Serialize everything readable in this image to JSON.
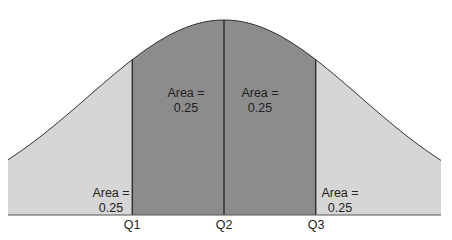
{
  "chart_data": {
    "type": "area",
    "title": "",
    "xlabel": "",
    "ylabel": "",
    "tick_labels": [
      "Q1",
      "Q2",
      "Q3"
    ],
    "regions": [
      {
        "name": "below-Q1",
        "label_line1": "Area =",
        "label_line2": "0.25",
        "area": 0.25,
        "fill": "#d6d6d6"
      },
      {
        "name": "Q1-Q2",
        "label_line1": "Area =",
        "label_line2": "0.25",
        "area": 0.25,
        "fill": "#8c8c8c"
      },
      {
        "name": "Q2-Q3",
        "label_line1": "Area =",
        "label_line2": "0.25",
        "area": 0.25,
        "fill": "#8c8c8c"
      },
      {
        "name": "above-Q3",
        "label_line1": "Area =",
        "label_line2": "0.25",
        "area": 0.25,
        "fill": "#d6d6d6"
      }
    ],
    "quartiles_z": [
      -0.6745,
      0,
      0.6745
    ],
    "grid": false,
    "legend": "none"
  },
  "labels": {
    "q1": "Q1",
    "q2": "Q2",
    "q3": "Q3",
    "area1_line1": "Area =",
    "area1_line2": "0.25",
    "area2_line1": "Area =",
    "area2_line2": "0.25",
    "area3_line1": "Area =",
    "area3_line2": "0.25",
    "area4_line1": "Area =",
    "area4_line2": "0.25"
  },
  "colors": {
    "tail_fill": "#d6d6d6",
    "center_fill": "#8c8c8c",
    "outline": "#333333"
  }
}
